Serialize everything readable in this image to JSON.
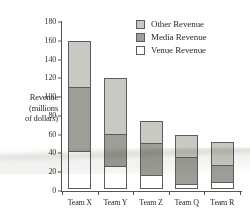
{
  "chart_data": {
    "type": "bar",
    "stacked": true,
    "title": "",
    "xlabel": "",
    "ylabel": "Revenue (millions of dollars)",
    "ylabel_lines": [
      "Revenue",
      "(millions",
      "of dollars)"
    ],
    "categories": [
      "Team X",
      "Team Y",
      "Team Z",
      "Team Q",
      "Team R"
    ],
    "series": [
      {
        "name": "Venue Revenue",
        "values": [
          40,
          25,
          15,
          5,
          7
        ],
        "color": "#ffffff"
      },
      {
        "name": "Media Revenue",
        "values": [
          70,
          35,
          35,
          30,
          20
        ],
        "color": "#9e9e99"
      },
      {
        "name": "Other Revenue",
        "values": [
          50,
          60,
          25,
          25,
          25
        ],
        "color": "#c9c9c4"
      }
    ],
    "cumulative_tops": {
      "venue": [
        40,
        25,
        15,
        5,
        7
      ],
      "media": [
        110,
        60,
        50,
        35,
        27
      ],
      "total": [
        160,
        120,
        75,
        60,
        52
      ]
    },
    "ylim": [
      0,
      180
    ],
    "yticks": [
      0,
      20,
      40,
      60,
      80,
      100,
      120,
      140,
      160,
      180
    ],
    "ytick_labels": [
      "0",
      "20",
      "40",
      "60",
      "80",
      "100",
      "120",
      "140",
      "160",
      "180"
    ],
    "grid": false,
    "legend_position": "top-right",
    "legend": [
      "Other Revenue",
      "Media Revenue",
      "Venue Revenue"
    ]
  },
  "legend": {
    "items": [
      {
        "label": "Other Revenue",
        "swatch": "other"
      },
      {
        "label": "Media Revenue",
        "swatch": "media"
      },
      {
        "label": "Venue Revenue",
        "swatch": "venue"
      }
    ]
  }
}
